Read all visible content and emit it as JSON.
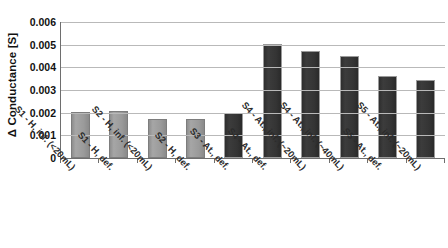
{
  "chart_data": {
    "type": "bar",
    "title": "",
    "xlabel": "",
    "ylabel": "Δ Conductance [S]",
    "ylim": [
      0,
      0.006
    ],
    "ytick_labels": [
      "0.006",
      "0.005",
      "0.004",
      "0.003",
      "0.002",
      "0.001",
      "0"
    ],
    "ytick_values": [
      0.006,
      0.005,
      0.004,
      0.003,
      0.002,
      0.001,
      0
    ],
    "grid": "horizontal",
    "legend": "none",
    "categories": [
      "S1 - H, inf. (<20mL)",
      "S1 - H, def.",
      "S2 - H, inf. (<20mL)",
      "S2 - H, def.",
      "S3 - At., def.",
      "S4 - At., def.",
      "S4 - At., inf. (~20mL)",
      "S4 - At., inf. (~40mL)",
      "S5 - At., def.",
      "S5 - At., inf. (~20mL)"
    ],
    "values": [
      0.00205,
      0.00208,
      0.00172,
      0.00173,
      0.00198,
      0.00505,
      0.00472,
      0.00452,
      0.00362,
      0.00345
    ],
    "bar_colors": [
      "#9a9a9a",
      "#9a9a9a",
      "#9a9a9a",
      "#9a9a9a",
      "#333333",
      "#333333",
      "#333333",
      "#333333",
      "#333333",
      "#333333"
    ],
    "bar_shades": [
      "light",
      "light",
      "light",
      "light",
      "dark",
      "dark",
      "dark",
      "dark",
      "dark",
      "dark"
    ],
    "colors": {
      "light_bar": "#9a9a9a",
      "dark_bar": "#333333",
      "gridline": "#b9b9b9",
      "axis": "#6e6e6e",
      "text": "#111111",
      "background": "#ffffff"
    }
  }
}
